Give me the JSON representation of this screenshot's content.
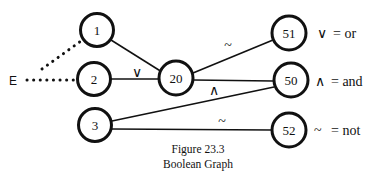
{
  "figure": {
    "caption_line1": "Figure 23.3",
    "caption_line2": "Boolean Graph"
  },
  "entry": {
    "label": "E"
  },
  "nodes": [
    {
      "id": "1",
      "label": "1"
    },
    {
      "id": "2",
      "label": "2"
    },
    {
      "id": "3",
      "label": "3"
    },
    {
      "id": "20",
      "label": "20"
    },
    {
      "id": "50",
      "label": "50"
    },
    {
      "id": "51",
      "label": "51"
    },
    {
      "id": "52",
      "label": "52"
    }
  ],
  "edge_labels": {
    "or_into_20": "∨",
    "not_to_51": "~",
    "and_to_50": "∧",
    "not_to_52": "~"
  },
  "legend": [
    {
      "symbol": "∨",
      "meaning": "= or"
    },
    {
      "symbol": "∧",
      "meaning": "= and"
    },
    {
      "symbol": "~",
      "meaning": "= not"
    }
  ],
  "colors": {
    "stroke": "#111111",
    "background": "#ffffff"
  }
}
